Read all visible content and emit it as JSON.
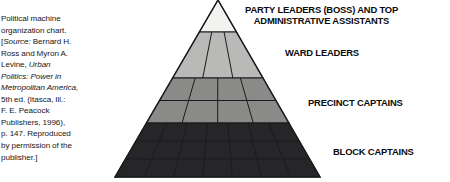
{
  "figure": {
    "type": "pyramid-hierarchy-diagram"
  },
  "caption": {
    "lines": [
      [
        {
          "t": "Political machine",
          "i": false
        }
      ],
      [
        {
          "t": "organization chart.",
          "i": false
        }
      ],
      [
        {
          "t": "[",
          "i": false
        },
        {
          "t": "Source:",
          "i": true
        },
        {
          "t": " Bernard H.",
          "i": false
        }
      ],
      [
        {
          "t": "Ross and Myron A.",
          "i": false
        }
      ],
      [
        {
          "t": "Levine, ",
          "i": false
        },
        {
          "t": "Urban",
          "i": true
        }
      ],
      [
        {
          "t": "Politics: Power in",
          "i": true
        }
      ],
      [
        {
          "t": "Metropolitan America,",
          "i": true
        }
      ],
      [
        {
          "t": "5th ed. (Itasca, Ill.:",
          "i": false
        }
      ],
      [
        {
          "t": "F. E. Peacock",
          "i": false
        }
      ],
      [
        {
          "t": "Publishers, 1996),",
          "i": false
        }
      ],
      [
        {
          "t": "p. 147. Reproduced",
          "i": false
        }
      ],
      [
        {
          "t": "by permission of the",
          "i": false
        }
      ],
      [
        {
          "t": "publisher.]",
          "i": false
        }
      ]
    ]
  },
  "chart_data": {
    "type": "pyramid",
    "orientation": "apex-top",
    "levels": [
      {
        "rank": 1,
        "label": "PARTY LEADERS (BOSS) AND TOP ADMINISTRATIVE ASSISTANTS",
        "label_lines": [
          "PARTY LEADERS (BOSS) AND TOP",
          "ADMINISTRATIVE ASSISTANTS"
        ],
        "fill": "#f2f2f0",
        "rows": 1,
        "cells": 1
      },
      {
        "rank": 2,
        "label": "WARD LEADERS",
        "label_lines": [
          "WARD LEADERS"
        ],
        "fill": "#b9b9b7",
        "rows": 1,
        "cells": 3
      },
      {
        "rank": 3,
        "label": "PRECINCT CAPTAINS",
        "label_lines": [
          "PRECINCT CAPTAINS"
        ],
        "fill": "#8a8a88",
        "rows": 2,
        "cells": 4
      },
      {
        "rank": 4,
        "label": "BLOCK CAPTAINS",
        "label_lines": [
          "BLOCK CAPTAINS"
        ],
        "fill": "#262628",
        "rows": 3,
        "cells": 7
      }
    ],
    "geometry": {
      "apex": [
        218,
        0
      ],
      "base_left": [
        115,
        177
      ],
      "base_right": [
        320,
        177
      ],
      "band_y": [
        0,
        32,
        78,
        123,
        177
      ],
      "stroke": "#1b1b1d"
    }
  }
}
